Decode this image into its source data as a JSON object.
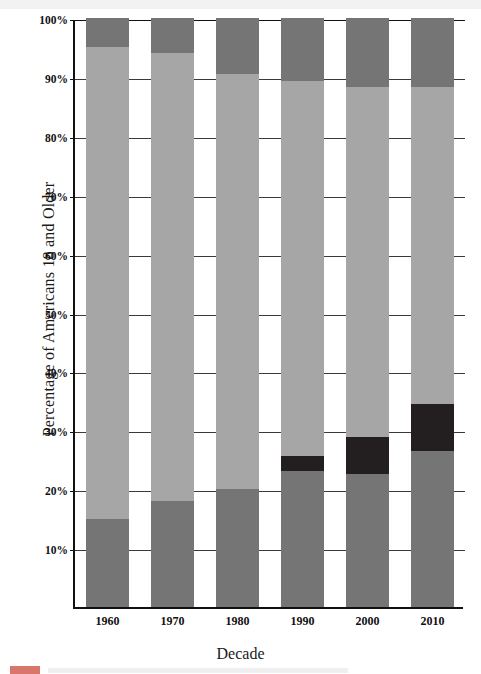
{
  "chart_data": {
    "type": "bar",
    "subtype": "stacked-bar-100-percent",
    "title": "",
    "xlabel": "Decade",
    "ylabel": "Percentage of Americans 18 and Older",
    "categories": [
      "1960",
      "1970",
      "1980",
      "1990",
      "2000",
      "2010"
    ],
    "ylim": [
      0,
      100
    ],
    "ytick_labels": [
      "10%",
      "20%",
      "30%",
      "40%",
      "50%",
      "60%",
      "70%",
      "80%",
      "90%",
      "100%"
    ],
    "ytick_values": [
      10,
      20,
      30,
      40,
      50,
      60,
      70,
      80,
      90,
      100
    ],
    "grid": true,
    "legend_position": "below-chart",
    "series": [
      {
        "name": "bottom-segment",
        "color": "#757575",
        "values": [
          15.0,
          18.0,
          20.0,
          23.1,
          22.5,
          26.5
        ]
      },
      {
        "name": "black-segment",
        "color": "#231f20",
        "values": [
          0.0,
          0.0,
          0.0,
          2.5,
          6.4,
          7.9
        ]
      },
      {
        "name": "middle-light-segment",
        "color": "#a6a6a6",
        "values": [
          80.0,
          76.1,
          70.5,
          63.7,
          59.4,
          53.9
        ]
      },
      {
        "name": "top-segment",
        "color": "#757575",
        "values": [
          5.0,
          5.9,
          9.5,
          10.7,
          11.7,
          11.7
        ]
      }
    ],
    "stack_boundaries_percent": {
      "1960": [
        0,
        15.0,
        15.0,
        95.0,
        100
      ],
      "1970": [
        0,
        18.0,
        18.0,
        94.1,
        100
      ],
      "1980": [
        0,
        20.0,
        20.0,
        90.5,
        100
      ],
      "1990": [
        0,
        23.1,
        25.6,
        89.3,
        100
      ],
      "2000": [
        0,
        22.5,
        28.9,
        88.3,
        100
      ],
      "2010": [
        0,
        26.5,
        34.4,
        88.3,
        100
      ]
    }
  },
  "colors": {
    "dark_gray": "#757575",
    "light_gray": "#a6a6a6",
    "black": "#231f20",
    "axis": "#111111",
    "grid": "#3a3a3a",
    "background": "#ffffff",
    "legend_accent": "#d8766b"
  },
  "axes": {
    "y_title": "Percentage of Americans 18 and Older",
    "x_title": "Decade"
  }
}
